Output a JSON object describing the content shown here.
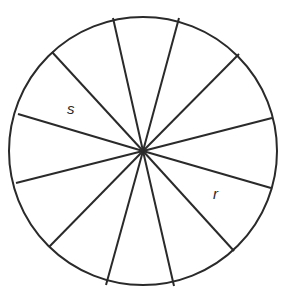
{
  "diagram": {
    "type": "circle divided into 12 sectors",
    "center": [
      143,
      151
    ],
    "radius": 134,
    "stroke_color": "#2a2a2a",
    "background": "#ffffff",
    "spoke_endpoints": [
      [
        113,
        18
      ],
      [
        179,
        18
      ],
      [
        239,
        54
      ],
      [
        272,
        118
      ],
      [
        271,
        188
      ],
      [
        234,
        251
      ],
      [
        174,
        286
      ],
      [
        106,
        285
      ],
      [
        49,
        247
      ],
      [
        16,
        183
      ],
      [
        18,
        114
      ],
      [
        52,
        52
      ]
    ],
    "labels": [
      {
        "text": "s",
        "x": 67,
        "y": 114
      },
      {
        "text": "r",
        "x": 213,
        "y": 199
      }
    ]
  }
}
